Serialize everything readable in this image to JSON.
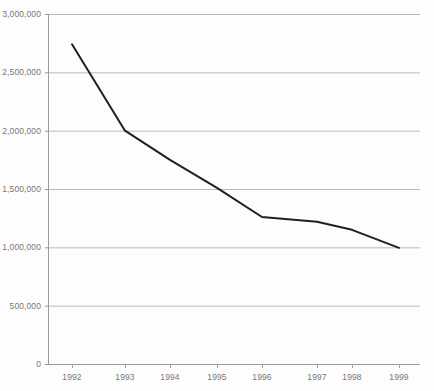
{
  "chart_data": {
    "type": "line",
    "title": "",
    "subtitle": "",
    "xlabel": "",
    "ylabel": "",
    "categories": [
      "1992",
      "1993",
      "1994",
      "1995",
      "1996",
      "1997",
      "1998",
      "1999"
    ],
    "x": [
      1992,
      1993,
      1994,
      1995,
      1996,
      1997,
      1998,
      1999
    ],
    "values": [
      2740000,
      2000000,
      1750000,
      1510000,
      1260000,
      1220000,
      1150000,
      995000
    ],
    "series": [
      {
        "name": "",
        "values": [
          2740000,
          2000000,
          1750000,
          1510000,
          1260000,
          1220000,
          1150000,
          995000
        ]
      }
    ],
    "ylim": [
      0,
      3000000
    ],
    "ytick_values": [
      0,
      500000,
      1000000,
      1500000,
      2000000,
      2500000,
      3000000
    ],
    "ytick_labels": [
      "0",
      "500,000",
      "1,000,000",
      "1,500,000",
      "2,000,000",
      "2,500,000",
      "3,000,000"
    ],
    "xtick_labels": [
      "1992",
      "1993",
      "1994",
      "1995",
      "1996",
      "1997",
      "1998",
      "1999"
    ],
    "grid": true,
    "grid_axis": "y",
    "legend": false,
    "legend_position": "none",
    "markers": false,
    "annotations": []
  },
  "style": {
    "background_color": "#fdfdfd",
    "line_color": "#1f1f1f",
    "line_width": 2,
    "grid_color": "#b9b9b9",
    "axis_color": "#9a9a9a",
    "tick_label_color": "#777777"
  },
  "geometry": {
    "plot_left": 48,
    "plot_right": 420,
    "plot_top": 14,
    "plot_bottom": 364,
    "x_positions": [
      72,
      125,
      170,
      217,
      262,
      317,
      352,
      399
    ],
    "y_positions_px": [
      42,
      131,
      160,
      188,
      217,
      222,
      230,
      248
    ]
  }
}
